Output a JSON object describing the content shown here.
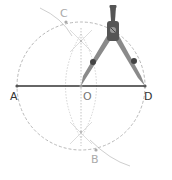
{
  "figure": {
    "points": {
      "A": {
        "label": "A",
        "x": 17,
        "y": 86
      },
      "D": {
        "label": "D",
        "x": 145,
        "y": 86
      },
      "O": {
        "label": "O",
        "x": 81,
        "y": 86
      },
      "C": {
        "label": "C",
        "x": 66,
        "y": 22
      },
      "B": {
        "label": "B",
        "x": 96,
        "y": 150
      }
    },
    "colors": {
      "segment": "#333333",
      "dashed_circle": "#b8b8b8",
      "construction": "#cfcfcf",
      "compass_dark": "#555555",
      "compass_mid": "#8a8a8a",
      "label_dark": "#333333",
      "label_light": "#aaaaaa"
    },
    "tool": "compass-icon"
  }
}
